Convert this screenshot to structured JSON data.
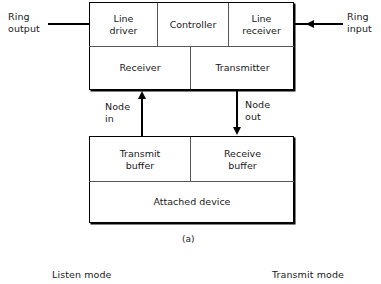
{
  "figure": {
    "caption": "(a)",
    "colors": {
      "line": "#000000",
      "divider": "#555555",
      "text": "#1a1a1a",
      "background": "#ffffff"
    }
  },
  "external_labels": {
    "ring_output": "Ring\noutput",
    "ring_input": "Ring\ninput"
  },
  "upper_unit": {
    "row1": [
      {
        "label": "Line\ndriver"
      },
      {
        "label": "Controller"
      },
      {
        "label": "Line\nreceiver"
      }
    ],
    "row2": [
      {
        "label": "Receiver"
      },
      {
        "label": "Transmitter"
      }
    ]
  },
  "interconnect": {
    "node_in": "Node\nin",
    "node_out": "Node\nout"
  },
  "lower_unit": {
    "row1": [
      {
        "label": "Transmit\nbuffer"
      },
      {
        "label": "Receive\nbuffer"
      }
    ],
    "row2": [
      {
        "label": "Attached device"
      }
    ]
  },
  "mode_labels": {
    "listen": "Listen mode",
    "transmit": "Transmit mode"
  }
}
